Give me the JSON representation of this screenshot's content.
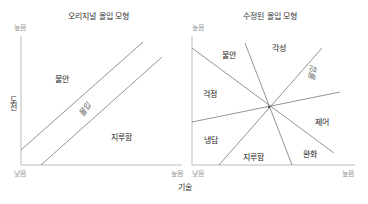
{
  "left_panel": {
    "title": "오리지널 몰입 모형",
    "y_high": "높음",
    "x_low": "낮음",
    "x_high": "높음",
    "y_axis_label": "도전",
    "regions": {
      "anxiety": "불안",
      "flow": "몰입",
      "boredom": "지루함"
    }
  },
  "right_panel": {
    "title": "수정된 몰입 모형",
    "y_high": "높음",
    "x_low": "낮음",
    "x_high": "높음",
    "regions": {
      "anxiety": "불안",
      "arousal": "각성",
      "worry": "걱정",
      "flow": "몰입",
      "apathy": "냉담",
      "control": "제어",
      "boredom": "지루함",
      "relaxation": "완화"
    }
  },
  "shared": {
    "x_axis_label": "기술"
  },
  "colors": {
    "line": "#777777",
    "axis": "#999999",
    "text": "#222222",
    "tick": "#999999"
  }
}
